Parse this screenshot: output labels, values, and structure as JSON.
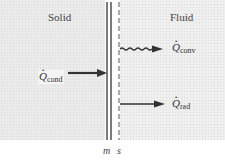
{
  "diagram": {
    "regions": [
      {
        "id": "solid",
        "label": "Solid"
      },
      {
        "id": "fluid",
        "label": "Fluid"
      }
    ],
    "heat_flows": {
      "conduction": {
        "symbol": "Q",
        "subscript": "cond",
        "direction": "toward boundary",
        "arrow_style": "straight"
      },
      "convection": {
        "symbol": "Q",
        "subscript": "conv",
        "direction": "away from boundary",
        "arrow_style": "wavy"
      },
      "radiation": {
        "symbol": "Q",
        "subscript": "rad",
        "direction": "away from boundary",
        "arrow_style": "straight"
      }
    },
    "boundary": {
      "left_label": "m",
      "right_label": "s",
      "left_line_style": "double solid",
      "right_line_style": "dashed"
    },
    "colors": {
      "background": "#ebebeb",
      "lines": "#333333",
      "text": "#333333"
    }
  }
}
